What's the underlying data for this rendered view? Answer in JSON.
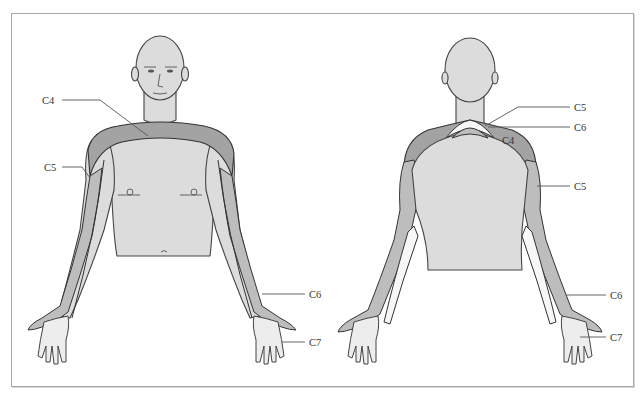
{
  "figure": {
    "colors": {
      "background": "#ffffff",
      "frame_border": "#a8a8a8",
      "skin": "#dcdcdc",
      "dermatome_dark": "#a3a3a3",
      "dermatome_mid": "#bdbdbd",
      "dermatome_light": "#f7f7f7",
      "outline": "#333333",
      "label_text": "#333333"
    }
  },
  "anterior_view": {
    "name": "Anterior view",
    "labels": [
      {
        "id": "ant_c4",
        "text": "C4"
      },
      {
        "id": "ant_c5",
        "text": "C5"
      },
      {
        "id": "ant_c6",
        "text": "C6"
      },
      {
        "id": "ant_c7",
        "text": "C7"
      }
    ]
  },
  "posterior_view": {
    "name": "Posterior view",
    "labels": [
      {
        "id": "post_c5_top",
        "text": "C5"
      },
      {
        "id": "post_c6_top",
        "text": "C6"
      },
      {
        "id": "post_c4",
        "text": "C4"
      },
      {
        "id": "post_c5_arm",
        "text": "C5"
      },
      {
        "id": "post_c6",
        "text": "C6"
      },
      {
        "id": "post_c7",
        "text": "C7"
      }
    ]
  }
}
